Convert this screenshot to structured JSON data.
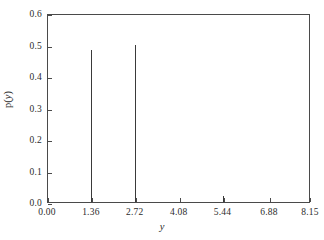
{
  "chart_data": {
    "type": "bar",
    "title": "",
    "subtitle": "",
    "xlabel": "y",
    "ylabel": "p(y)",
    "ylabel_parts": {
      "p": "p",
      "open": "(",
      "var": "y",
      "close": ")"
    },
    "x": [
      1.36,
      2.72,
      5.44
    ],
    "values": [
      0.483,
      0.498,
      0.02
    ],
    "categories": [
      "1.36",
      "2.72",
      "5.44"
    ],
    "series": [
      {
        "name": "p(y)",
        "points": [
          {
            "x": 1.36,
            "y": 0.483
          },
          {
            "x": 2.72,
            "y": 0.498
          },
          {
            "x": 5.44,
            "y": 0.02
          }
        ]
      }
    ],
    "xlim": [
      0.0,
      8.15
    ],
    "ylim": [
      0.0,
      0.6
    ],
    "xticks": [
      0.0,
      1.36,
      2.72,
      4.08,
      5.44,
      6.88,
      8.15
    ],
    "xticklabels": [
      "0.00",
      "1.36",
      "2.72",
      "4.08",
      "5.44",
      "6.88",
      "8.15"
    ],
    "yticks": [
      0.0,
      0.1,
      0.2,
      0.3,
      0.4,
      0.5,
      0.6
    ],
    "yticklabels": [
      "0.0",
      "0.1",
      "0.2",
      "0.3",
      "0.4",
      "0.5",
      "0.6"
    ],
    "grid": false,
    "legend": null,
    "legend_position": "none",
    "colors": {
      "background": "#ffffff",
      "axis": "#4a4a4a",
      "data": "#3a3a3a",
      "text": "#2b2b2b"
    }
  }
}
